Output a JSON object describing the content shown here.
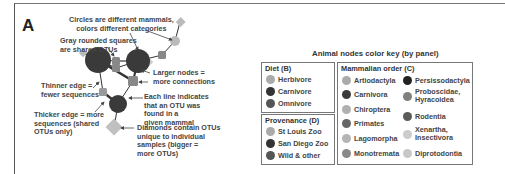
{
  "panel_label": "A",
  "annotations": {
    "circles": [
      "Circles are different mammals,",
      "colors different categories"
    ],
    "squares": [
      "Gray rounded squares",
      "are shared OTUs"
    ],
    "larger": [
      "Larger nodes =",
      "more connections"
    ],
    "thinner": [
      "Thinner edge =",
      "fewer sequences"
    ],
    "eachline": [
      "Each line indicates",
      "that an OTU was",
      "found in a",
      "given mammal"
    ],
    "thicker": [
      "Thicker edge = more",
      "sequences (shared",
      "OTUs only)"
    ],
    "diamonds": [
      "Diamonds contain OTUs",
      "unique to individual",
      "samples (bigger =",
      "more OTUs)"
    ]
  },
  "key": {
    "title": "Animal nodes color key (by panel)",
    "diet": {
      "title": "Diet (B)",
      "items": [
        {
          "label": "Herbivore",
          "color": "#aaaaaa"
        },
        {
          "label": "Carnivore",
          "color": "#333333"
        },
        {
          "label": "Omnivore",
          "color": "#555555"
        }
      ]
    },
    "provenance": {
      "title": "Provenance (D)",
      "items": [
        {
          "label": "St Louis Zoo",
          "color": "#aaaaaa"
        },
        {
          "label": "San Diego Zoo",
          "color": "#333333"
        },
        {
          "label": "Wild & other",
          "color": "#555555"
        }
      ]
    },
    "order": {
      "title": "Mammalian order (C)",
      "col1": [
        {
          "label": "Artiodactyla",
          "color": "#aaaaaa"
        },
        {
          "label": "Carnivora",
          "color": "#3a3a3a"
        },
        {
          "label": "Chiroptera",
          "color": "#b0b0b0"
        },
        {
          "label": "Primates",
          "color": "#666666"
        },
        {
          "label": "Lagomorpha",
          "color": "#b5b5b5"
        },
        {
          "label": "Monotremata",
          "color": "#8a8a8a"
        }
      ],
      "col2": [
        {
          "label": "Persissodactyla",
          "color": "#222222"
        },
        {
          "label": "Proboscidae,",
          "label2": "Hyracoidea",
          "color": "#808080"
        },
        {
          "label": "Rodentia",
          "color": "#5a5a5a"
        },
        {
          "label": "Xenartha,",
          "label2": "Insectivora",
          "color": "#cccccc"
        },
        {
          "label": "Diprotodontia",
          "color": "#c8c8c8"
        }
      ]
    }
  }
}
